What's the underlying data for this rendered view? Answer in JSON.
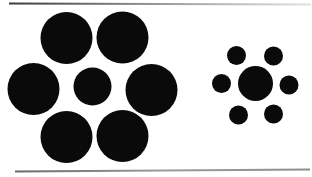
{
  "figure": {
    "type": "ebbinghaus-illusion",
    "background": "#ffffff",
    "circle_fill": "#0a0a0a",
    "canvas": {
      "width": 312,
      "height": 177
    },
    "left_group": {
      "label": "large-inducers-group",
      "center_circle": {
        "cx": 92.5,
        "cy": 86.5,
        "r": 19
      },
      "inducer_radius": 26,
      "inducers": [
        {
          "cx": 66.5,
          "cy": 38
        },
        {
          "cx": 122.5,
          "cy": 37.5
        },
        {
          "cx": 33.5,
          "cy": 89
        },
        {
          "cx": 151.5,
          "cy": 90
        },
        {
          "cx": 66.5,
          "cy": 137
        },
        {
          "cx": 122.5,
          "cy": 136
        }
      ]
    },
    "right_group": {
      "label": "small-inducers-group",
      "center_circle": {
        "cx": 255.5,
        "cy": 83.5,
        "r": 17.5
      },
      "inducer_radius": 9.5,
      "inducers": [
        {
          "cx": 236.5,
          "cy": 55.5
        },
        {
          "cx": 273.5,
          "cy": 56
        },
        {
          "cx": 221.5,
          "cy": 83.5
        },
        {
          "cx": 289,
          "cy": 85
        },
        {
          "cx": 238.5,
          "cy": 115
        },
        {
          "cx": 273.5,
          "cy": 114
        }
      ]
    },
    "rules": {
      "top_line": {
        "x1": 9,
        "y1": 3.5,
        "x2": 311,
        "y2": 4.5,
        "stroke_width": 2.2,
        "gradient": [
          "#3a3a3a",
          "#9a9a9a",
          "#e2e2e2"
        ]
      },
      "bottom_line": {
        "x1": 15,
        "y1": 171.5,
        "x2": 310,
        "y2": 169.5,
        "stroke_width": 2,
        "gradient": [
          "#6a6a6a",
          "#9b9b9b",
          "#8d8d8d"
        ]
      }
    }
  }
}
